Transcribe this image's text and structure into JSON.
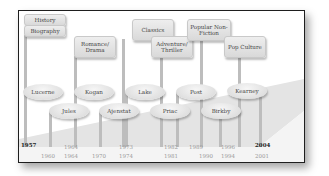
{
  "categories": [
    {
      "label": "History",
      "x": 5,
      "y": 3,
      "w": 40,
      "h": 10
    },
    {
      "label": "Biography",
      "x": 5,
      "y": 14,
      "w": 40,
      "h": 10
    },
    {
      "label": "Romance/ Drama",
      "x": 55,
      "y": 25,
      "w": 40,
      "h": 20
    },
    {
      "label": "Classics",
      "x": 113,
      "y": 8,
      "w": 40,
      "h": 20
    },
    {
      "label": "Adventure/ Thriller",
      "x": 132,
      "y": 25,
      "w": 40,
      "h": 20
    },
    {
      "label": "Popular Non-Fiction",
      "x": 168,
      "y": 8,
      "w": 42,
      "h": 20
    },
    {
      "label": "Pop Culture",
      "x": 205,
      "y": 25,
      "w": 40,
      "h": 20
    }
  ],
  "authors": [
    {
      "name": "Lucerne",
      "x": 4,
      "y": 73
    },
    {
      "name": "Kogan",
      "x": 55,
      "y": 73
    },
    {
      "name": "Lake",
      "x": 106,
      "y": 73
    },
    {
      "name": "Post",
      "x": 157,
      "y": 73
    },
    {
      "name": "Kearney",
      "x": 208,
      "y": 72
    },
    {
      "name": "Jules",
      "x": 30,
      "y": 92
    },
    {
      "name": "Ajenstat",
      "x": 80,
      "y": 92
    },
    {
      "name": "Priac",
      "x": 131,
      "y": 92
    },
    {
      "name": "Birkby",
      "x": 182,
      "y": 92
    }
  ],
  "lines": [
    {
      "x": 5,
      "y": 24,
      "h": 112
    },
    {
      "x": 30,
      "y": 100,
      "h": 36
    },
    {
      "x": 55,
      "y": 45,
      "h": 91
    },
    {
      "x": 80,
      "y": 100,
      "h": 36
    },
    {
      "x": 103,
      "y": 28,
      "h": 108
    },
    {
      "x": 106,
      "y": 81,
      "h": 55
    },
    {
      "x": 141,
      "y": 45,
      "h": 91
    },
    {
      "x": 157,
      "y": 81,
      "h": 55
    },
    {
      "x": 181,
      "y": 28,
      "h": 108
    },
    {
      "x": 200,
      "y": 100,
      "h": 36
    },
    {
      "x": 219,
      "y": 45,
      "h": 91
    },
    {
      "x": 240,
      "y": 80,
      "h": 56
    }
  ],
  "years_upper": [
    {
      "label": "1957",
      "x": 2,
      "y": 131,
      "dark": true
    },
    {
      "label": "1964",
      "x": 45,
      "y": 133
    },
    {
      "label": "1973",
      "x": 100,
      "y": 133
    },
    {
      "label": "1982",
      "x": 145,
      "y": 133
    },
    {
      "label": "1989",
      "x": 170,
      "y": 133
    },
    {
      "label": "1996",
      "x": 202,
      "y": 133
    },
    {
      "label": "2004",
      "x": 236,
      "y": 131,
      "dark": true
    }
  ],
  "years_lower": [
    {
      "label": "1960",
      "x": 22,
      "y": 142
    },
    {
      "label": "1964",
      "x": 45,
      "y": 142
    },
    {
      "label": "1970",
      "x": 73,
      "y": 142
    },
    {
      "label": "1974",
      "x": 100,
      "y": 142
    },
    {
      "label": "1981",
      "x": 145,
      "y": 142
    },
    {
      "label": "1990",
      "x": 180,
      "y": 142
    },
    {
      "label": "1994",
      "x": 202,
      "y": 142
    },
    {
      "label": "2001",
      "x": 236,
      "y": 142
    }
  ],
  "colors": {
    "frame_border": "#1e1e1e",
    "wedge": "#e2e2e2",
    "line": "#bdbdbd",
    "box_fill": "#e3e3e3"
  }
}
